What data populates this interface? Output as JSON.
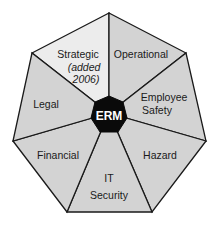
{
  "diagram": {
    "center": {
      "label": "ERM",
      "fill": "#0a0a0a",
      "text_color": "#ffffff"
    },
    "segment_fill": "#d3d3d3",
    "highlight_fill": "#ececec",
    "stroke": "#1a1a1a",
    "segments": [
      {
        "label_lines": [
          "Strategic",
          "(added",
          "2006)"
        ],
        "highlighted": true
      },
      {
        "label_lines": [
          "Operational"
        ],
        "highlighted": false
      },
      {
        "label_lines": [
          "Employee",
          "Safety"
        ],
        "highlighted": false
      },
      {
        "label_lines": [
          "Hazard"
        ],
        "highlighted": false
      },
      {
        "label_lines": [
          "IT",
          "Security"
        ],
        "highlighted": false
      },
      {
        "label_lines": [
          "Financial"
        ],
        "highlighted": false
      },
      {
        "label_lines": [
          "Legal"
        ],
        "highlighted": false
      }
    ]
  },
  "labels": {
    "strategic_1": "Strategic",
    "strategic_2": "(added",
    "strategic_3": "2006)",
    "operational": "Operational",
    "employee": "Employee",
    "safety": "Safety",
    "hazard": "Hazard",
    "it": "IT",
    "security": "Security",
    "financial": "Financial",
    "legal": "Legal",
    "center": "ERM"
  }
}
